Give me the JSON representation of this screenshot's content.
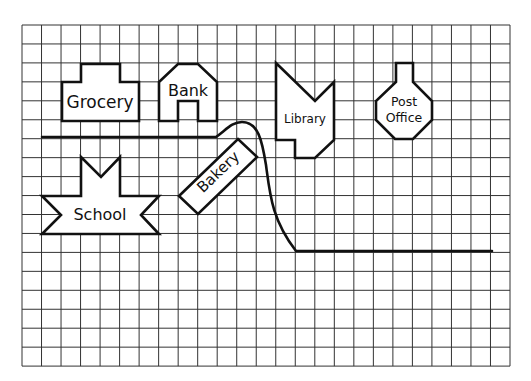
{
  "map": {
    "grid": {
      "x": 22,
      "y": 25,
      "cols": 25,
      "rows": 18,
      "cell_w": 19.52,
      "cell_h": 18.95,
      "line_color": "#333333"
    },
    "stroke_color": "#111111",
    "buildings": [
      {
        "name": "Grocery",
        "label": "Grocery",
        "points": "62,82 81,82 81,64 120,64 120,82 139,82 139,121 62,121",
        "label_x": 100,
        "label_y": 108,
        "font_size": 17
      },
      {
        "name": "Bank",
        "label": "Bank",
        "points": "159,82 178,64 198,64 217,82 217,121 198,121 198,101 178,101 178,121 159,121",
        "label_x": 188,
        "label_y": 96,
        "font_size": 16
      },
      {
        "name": "Library",
        "label": "Library",
        "points": "276,63 315,101 334,82 334,140 315,158 295,158 295,140 276,140",
        "label_x": 305,
        "label_y": 123,
        "font_size": 12
      },
      {
        "name": "Post Office",
        "label_lines": [
          "Post",
          "Office"
        ],
        "points": "396,63 413,63 413,82 432,101 432,120 413,139 395,139 376,120 376,101 396,82",
        "label_x": 404,
        "label_y": [
          106,
          122
        ],
        "font_size": 12.5
      },
      {
        "name": "School",
        "label": "School",
        "points": "81,157 101,177 120,157 120,196 159,196 141,215 159,234 42,234 61,215 42,196 81,196",
        "label_x": 100,
        "label_y": 220,
        "font_size": 16
      },
      {
        "name": "Bakery",
        "label": "Bakery",
        "points": "179,196 238,139 257,157 198,214",
        "label_x": 218,
        "label_y": 177,
        "font_size": 15,
        "rotate": -44
      }
    ],
    "road": {
      "path": "M 42 137 L 216 137 C 226 130, 232 122, 242 122 C 258 122, 262 140, 266 165 C 270 195, 272 220, 296 251 L 492 251"
    }
  }
}
